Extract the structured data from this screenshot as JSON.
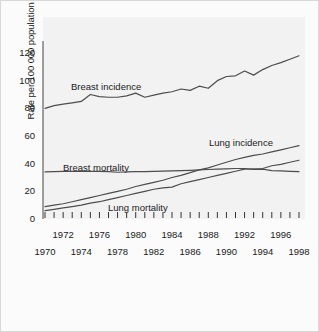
{
  "chart_data": {
    "type": "line",
    "title": "",
    "xlabel": "",
    "ylabel": "Rate per 100 000 population",
    "xlim": [
      1970,
      1999
    ],
    "ylim": [
      0,
      130
    ],
    "yticks": [
      0,
      20,
      40,
      60,
      80,
      100,
      120
    ],
    "ytick_labels": [
      "0",
      "20",
      "40",
      "60",
      "80",
      "100",
      "120"
    ],
    "xticks_upper": [
      1972,
      1976,
      1980,
      1984,
      1988,
      1992,
      1996
    ],
    "xticks_lower": [
      1970,
      1974,
      1978,
      1982,
      1986,
      1990,
      1994,
      1998
    ],
    "xtick_labels_upper": [
      "1972",
      "1976",
      "1980",
      "1984",
      "1988",
      "1992",
      "1996"
    ],
    "xtick_labels_lower": [
      "1970",
      "1974",
      "1978",
      "1982",
      "1986",
      "1990",
      "1994",
      "1998"
    ],
    "minor_tick_every_year": true,
    "grid": false,
    "legend_position": "inline-annotations",
    "x": [
      1970,
      1971,
      1972,
      1973,
      1974,
      1975,
      1976,
      1977,
      1978,
      1979,
      1980,
      1981,
      1982,
      1983,
      1984,
      1985,
      1986,
      1987,
      1988,
      1989,
      1990,
      1991,
      1992,
      1993,
      1994,
      1995,
      1996,
      1997,
      1998
    ],
    "series": [
      {
        "name": "Breast incidence",
        "color": "#4d4d4d",
        "values": [
          80.0,
          82.0,
          83.0,
          84.0,
          85.0,
          90.0,
          88.5,
          88.0,
          88.0,
          89.0,
          91.0,
          88.0,
          89.5,
          91.0,
          92.0,
          94.0,
          93.0,
          96.0,
          94.5,
          100.0,
          103.0,
          103.5,
          107.0,
          104.0,
          108.0,
          111.0,
          113.0,
          115.5,
          118.0
        ]
      },
      {
        "name": "Lung incidence",
        "color": "#4d4d4d",
        "values": [
          9.0,
          10.0,
          11.0,
          12.5,
          14.0,
          15.5,
          17.0,
          18.5,
          20.0,
          21.5,
          23.5,
          25.0,
          26.5,
          28.0,
          30.0,
          31.5,
          33.5,
          35.5,
          37.0,
          39.0,
          41.0,
          43.0,
          44.5,
          46.0,
          47.0,
          48.5,
          50.0,
          51.5,
          53.0
        ]
      },
      {
        "name": "Breast mortality",
        "color": "#4d4d4d",
        "values": [
          34.0,
          34.2,
          34.5,
          34.5,
          34.6,
          34.5,
          34.4,
          34.3,
          33.8,
          34.0,
          34.2,
          34.3,
          34.5,
          34.6,
          34.8,
          35.0,
          35.2,
          35.5,
          35.8,
          36.0,
          36.2,
          36.5,
          36.5,
          35.8,
          36.0,
          35.0,
          34.8,
          34.5,
          34.2
        ]
      },
      {
        "name": "Lung mortality",
        "color": "#4d4d4d",
        "values": [
          6.0,
          7.0,
          8.0,
          9.0,
          10.0,
          11.5,
          12.5,
          14.0,
          15.5,
          17.0,
          18.5,
          20.0,
          21.5,
          22.5,
          23.0,
          25.5,
          27.0,
          28.5,
          30.0,
          31.5,
          33.0,
          34.5,
          36.0,
          36.2,
          36.5,
          38.5,
          39.5,
          41.0,
          42.5
        ]
      }
    ],
    "annotations": [
      {
        "text": "Breast incidence",
        "x_px": 70,
        "y_px": 80
      },
      {
        "text": "Lung incidence",
        "x_px": 208,
        "y_px": 136
      },
      {
        "text": "Breast mortality",
        "x_px": 62,
        "y_px": 161
      },
      {
        "text": "Lung mortality",
        "x_px": 107,
        "y_px": 201
      }
    ]
  }
}
